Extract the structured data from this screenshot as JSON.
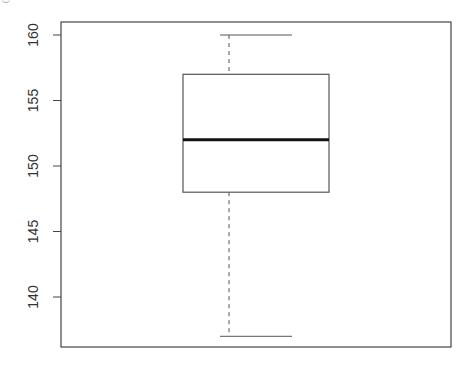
{
  "chart_data": {
    "type": "box",
    "title": "",
    "xlabel": "",
    "ylabel": "",
    "ylim": [
      136,
      161
    ],
    "yticks": [
      140,
      145,
      150,
      155,
      160
    ],
    "ytick_labels": [
      "140",
      "145",
      "150",
      "155",
      "160"
    ],
    "grid": false,
    "legend": null,
    "series": [
      {
        "name": "",
        "whisker_low": 137,
        "q1": 148,
        "median": 152,
        "q3": 157,
        "whisker_high": 160
      }
    ]
  },
  "layout": {
    "frame": {
      "left": 61,
      "top": 22,
      "right": 451,
      "bottom": 347
    },
    "y_px": {
      "value_a": 160,
      "px_a": 35,
      "value_b": 140,
      "px_b": 297
    },
    "box": {
      "left": 183,
      "right": 329
    },
    "whisker_cap": {
      "left": 220,
      "right": 292
    },
    "colors": {
      "frame": "#444444",
      "box": "#555555",
      "median": "#111111",
      "text": "#333333"
    }
  }
}
